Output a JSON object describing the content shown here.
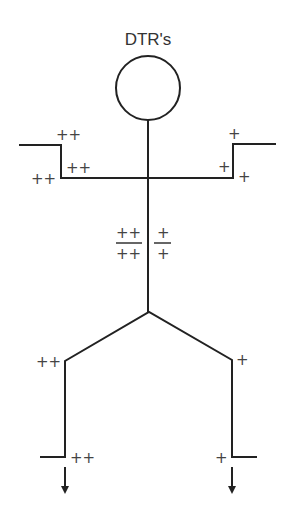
{
  "title": "DTR's",
  "labels": {
    "upper_left_step_top": "++",
    "upper_left_step_inner": "++",
    "upper_left_step_outer": "++",
    "upper_right_step_top": "+",
    "upper_right_step_inner": "+",
    "upper_right_step_outer": "+",
    "stem_left_numerator": "++",
    "stem_left_denominator": "++",
    "stem_right_numerator": "+",
    "stem_right_denominator": "+",
    "branch_left_top": "++",
    "branch_right_top": "+",
    "foot_left": "++",
    "foot_right": "+"
  }
}
